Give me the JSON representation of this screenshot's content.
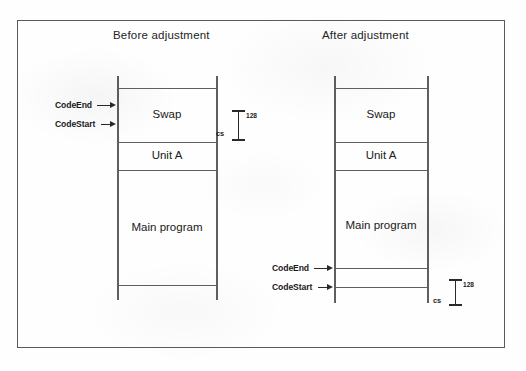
{
  "figure": {
    "type": "memory-layout-diagram",
    "panels": [
      {
        "id": "before",
        "title": "Before adjustment",
        "segments": [
          {
            "label": "Swap"
          },
          {
            "label": "Unit A"
          },
          {
            "label": "Main program"
          }
        ],
        "pointers": [
          {
            "label": "CodeEnd"
          },
          {
            "label": "CodeStart"
          }
        ],
        "annotation": {
          "name": "cs",
          "size": "128"
        }
      },
      {
        "id": "after",
        "title": "After adjustment",
        "segments": [
          {
            "label": "Swap"
          },
          {
            "label": "Unit A"
          },
          {
            "label": "Main program"
          }
        ],
        "pointers": [
          {
            "label": "CodeEnd"
          },
          {
            "label": "CodeStart"
          }
        ],
        "annotation": {
          "name": "cs",
          "size": "128"
        }
      }
    ]
  },
  "colors": {
    "ink": "#2a2a2a",
    "rule": "#5f5f5f",
    "frame": "#5a5a5a",
    "paper": "#fefefe"
  }
}
